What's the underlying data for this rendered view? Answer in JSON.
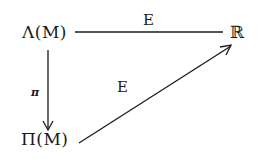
{
  "diagram": {
    "type": "commutative-diagram",
    "nodes": {
      "lambda_m": "Λ(M)",
      "pi_m": "Π(M)",
      "reals": "ℝ"
    },
    "edges": [
      {
        "from": "Λ(M)",
        "to": "ℝ",
        "label": "E",
        "style": "line"
      },
      {
        "from": "Λ(M)",
        "to": "Π(M)",
        "label": "π",
        "style": "arrow"
      },
      {
        "from": "Π(M)",
        "to": "ℝ",
        "label": "E",
        "style": "arrow"
      }
    ],
    "labels": {
      "top_edge": "E",
      "vertical_edge": "π",
      "diagonal_edge": "E"
    },
    "colors": {
      "ink": "#1a1a1a",
      "background": "#ffffff"
    }
  }
}
